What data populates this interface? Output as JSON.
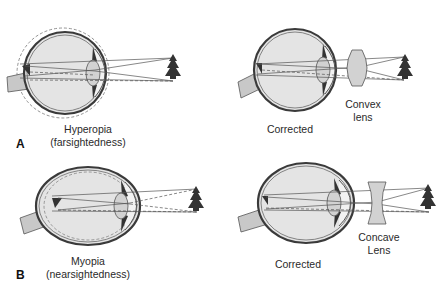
{
  "figure": {
    "panels": [
      {
        "letter": "A",
        "condition": {
          "title": "Hyperopia",
          "subtitle": "(farsightedness)"
        },
        "corrected_label": "Corrected",
        "lens": {
          "type": "convex",
          "line1": "Convex",
          "line2": "lens"
        }
      },
      {
        "letter": "B",
        "condition": {
          "title": "Myopia",
          "subtitle": "(nearsightedness)"
        },
        "corrected_label": "Corrected",
        "lens": {
          "type": "concave",
          "line1": "Concave",
          "line2": "Lens"
        }
      }
    ],
    "colors": {
      "eye_fill": "#e4e4e4",
      "eye_outline": "#3a3a3a",
      "lens_fill": "#d2d2d2",
      "tree": "#333333",
      "optic_nerve": "#c8c8c8",
      "ray": "#555555"
    }
  }
}
